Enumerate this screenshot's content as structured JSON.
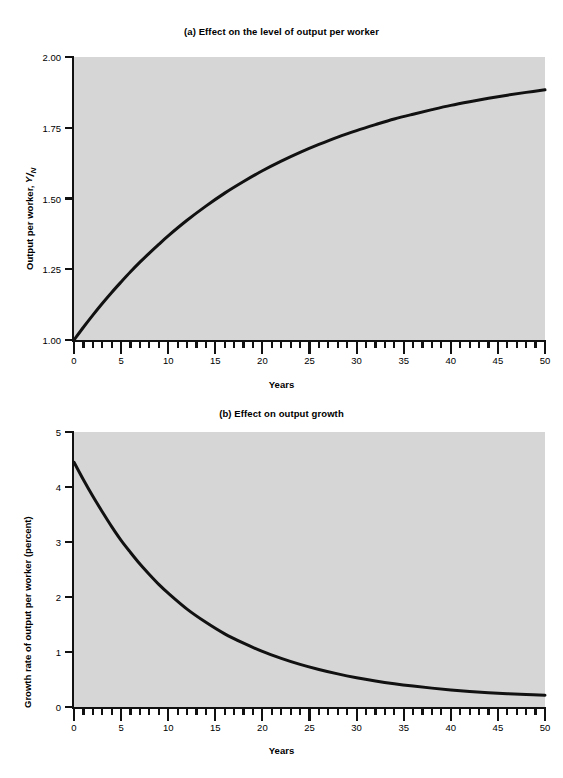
{
  "chart_data": [
    {
      "id": "panel-a",
      "type": "line",
      "title": "(a) Effect on the level of output per worker",
      "xlabel": "Years",
      "ylabel": "Output per worker, Y/N",
      "ylabel_main": "Output per worker, ",
      "ylabel_numerator": "Y",
      "ylabel_slash": "/",
      "ylabel_denominator": "N",
      "xlim": [
        0,
        50
      ],
      "ylim": [
        1.0,
        2.0
      ],
      "xticks": [
        0,
        5,
        10,
        15,
        20,
        25,
        30,
        35,
        40,
        45,
        50
      ],
      "xtick_labels": [
        "0",
        "5",
        "10",
        "15",
        "20",
        "25",
        "30",
        "35",
        "40",
        "45",
        "50"
      ],
      "xminor_step": 1,
      "yticks": [
        1.0,
        1.25,
        1.5,
        1.75,
        2.0
      ],
      "ytick_labels": [
        "1.00",
        "1.25",
        "1.50",
        "1.75",
        "2.00"
      ],
      "grid": false,
      "legend": "none",
      "plot_background": "#d6d6d6",
      "line_color": "#111111",
      "x": [
        0,
        1,
        2,
        3,
        4,
        5,
        6,
        7,
        8,
        9,
        10,
        12,
        14,
        16,
        18,
        20,
        22,
        24,
        26,
        28,
        30,
        32,
        34,
        36,
        38,
        40,
        42,
        44,
        46,
        48,
        50
      ],
      "y": [
        1.0,
        1.045,
        1.088,
        1.129,
        1.168,
        1.205,
        1.241,
        1.275,
        1.307,
        1.338,
        1.368,
        1.423,
        1.473,
        1.519,
        1.56,
        1.598,
        1.632,
        1.663,
        1.691,
        1.717,
        1.74,
        1.761,
        1.781,
        1.798,
        1.814,
        1.829,
        1.842,
        1.854,
        1.865,
        1.875,
        1.884
      ]
    },
    {
      "id": "panel-b",
      "type": "line",
      "title": "(b) Effect on output growth",
      "xlabel": "Years",
      "ylabel": "Growth rate of output per worker (percent)",
      "xlim": [
        0,
        50
      ],
      "ylim": [
        0,
        5
      ],
      "xticks": [
        0,
        5,
        10,
        15,
        20,
        25,
        30,
        35,
        40,
        45,
        50
      ],
      "xtick_labels": [
        "0",
        "5",
        "10",
        "15",
        "20",
        "25",
        "30",
        "35",
        "40",
        "45",
        "50"
      ],
      "xminor_step": 1,
      "yticks": [
        0,
        1,
        2,
        3,
        4,
        5
      ],
      "ytick_labels": [
        "0",
        "1",
        "2",
        "3",
        "4",
        "5"
      ],
      "grid": false,
      "legend": "none",
      "plot_background": "#d6d6d6",
      "line_color": "#111111",
      "x": [
        0,
        1,
        2,
        3,
        4,
        5,
        6,
        7,
        8,
        9,
        10,
        12,
        14,
        16,
        18,
        20,
        22,
        24,
        26,
        28,
        30,
        32,
        34,
        36,
        38,
        40,
        42,
        44,
        46,
        48,
        50
      ],
      "y": [
        4.45,
        4.13,
        3.83,
        3.55,
        3.28,
        3.03,
        2.81,
        2.6,
        2.41,
        2.23,
        2.07,
        1.78,
        1.54,
        1.33,
        1.16,
        1.01,
        0.885,
        0.775,
        0.682,
        0.602,
        0.533,
        0.474,
        0.423,
        0.38,
        0.343,
        0.311,
        0.284,
        0.261,
        0.242,
        0.226,
        0.213
      ]
    }
  ]
}
